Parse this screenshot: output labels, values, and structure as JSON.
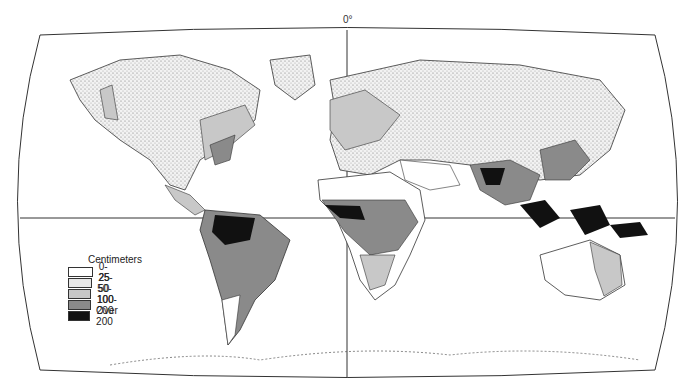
{
  "map": {
    "title": "World annual precipitation",
    "meridian_label": "0°",
    "legend": {
      "title": "Centimeters",
      "items": [
        {
          "label": "0-25",
          "color": "#ffffff"
        },
        {
          "label": "25-50",
          "color": "#e6e6e6"
        },
        {
          "label": "50-100",
          "color": "#c8c8c8"
        },
        {
          "label": "100-200",
          "color": "#8a8a8a"
        },
        {
          "label": "Over 200",
          "color": "#111111"
        }
      ]
    }
  }
}
